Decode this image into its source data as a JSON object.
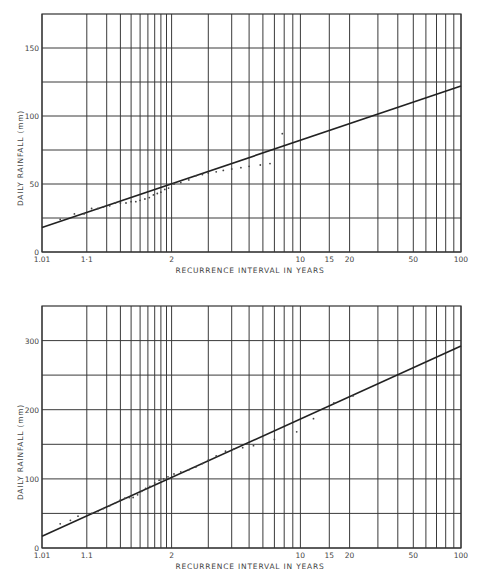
{
  "chart_data": [
    {
      "type": "line",
      "title": "",
      "xlabel": "RECURRENCE  INTERVAL  IN  YEARS",
      "ylabel": "DAILY  RAINFALL  (mm)",
      "x_scale": "gumbel-probability",
      "x_tick_labels": [
        "1.01",
        "1·1",
        "2",
        "10",
        "15",
        "20",
        "50",
        "100"
      ],
      "x_tick_values": [
        1.01,
        1.1,
        2,
        10,
        15,
        20,
        50,
        100
      ],
      "x_gridlines": [
        1.01,
        1.1,
        1.2,
        1.3,
        1.4,
        1.5,
        1.6,
        1.7,
        1.8,
        1.9,
        2,
        3,
        4,
        5,
        6,
        7,
        8,
        9,
        10,
        15,
        20,
        30,
        40,
        50,
        60,
        70,
        80,
        90,
        100
      ],
      "y_tick_labels": [
        "0",
        "50",
        "100",
        "150"
      ],
      "y_gridlines": [
        0,
        25,
        50,
        75,
        100,
        125,
        150
      ],
      "ylim": [
        0,
        175
      ],
      "xlim": [
        1.01,
        100
      ],
      "grid": true,
      "series": [
        {
          "name": "fitted line",
          "kind": "line",
          "x": [
            1.01,
            100
          ],
          "y": [
            18,
            122
          ]
        },
        {
          "name": "observed",
          "kind": "scatter",
          "x": [
            1.03,
            1.06,
            1.09,
            1.12,
            1.15,
            1.18,
            1.22,
            1.26,
            1.3,
            1.35,
            1.4,
            1.45,
            1.5,
            1.56,
            1.62,
            1.68,
            1.74,
            1.8,
            1.87,
            1.94,
            2.05,
            2.2,
            2.4,
            2.6,
            2.8,
            3.0,
            3.3,
            3.6,
            4.0,
            4.5,
            5.0,
            5.8,
            6.6,
            7.8
          ],
          "y": [
            24,
            28,
            28,
            32,
            32,
            33,
            34,
            36,
            36,
            36,
            37,
            37,
            38,
            39,
            40,
            42,
            43,
            44,
            46,
            47,
            50,
            51,
            53,
            56,
            57,
            58,
            59,
            60,
            61,
            62,
            63,
            64,
            65,
            87
          ]
        }
      ]
    },
    {
      "type": "line",
      "title": "",
      "xlabel": "RECURRENCE  INTERVAL  IN  YEARS",
      "ylabel": "DAILY  RAINFALL  (mm)",
      "x_scale": "gumbel-probability",
      "x_tick_labels": [
        "1.01",
        "1.1",
        "2",
        "10",
        "15",
        "20",
        "50",
        "100"
      ],
      "x_tick_values": [
        1.01,
        1.1,
        2,
        10,
        15,
        20,
        50,
        100
      ],
      "x_gridlines": [
        1.01,
        1.1,
        1.2,
        1.3,
        1.4,
        1.5,
        1.6,
        1.7,
        1.8,
        1.9,
        2,
        3,
        4,
        5,
        6,
        7,
        8,
        9,
        10,
        15,
        20,
        30,
        40,
        50,
        60,
        70,
        80,
        90,
        100
      ],
      "y_tick_labels": [
        "0",
        "100",
        "200",
        "300"
      ],
      "y_gridlines": [
        0,
        50,
        100,
        150,
        200,
        250,
        300
      ],
      "ylim": [
        0,
        350
      ],
      "xlim": [
        1.01,
        100
      ],
      "grid": true,
      "series": [
        {
          "name": "fitted line",
          "kind": "line",
          "x": [
            1.01,
            100
          ],
          "y": [
            17,
            292
          ]
        },
        {
          "name": "observed",
          "kind": "scatter",
          "x": [
            1.03,
            1.05,
            1.07,
            1.12,
            1.15,
            1.18,
            1.22,
            1.26,
            1.3,
            1.34,
            1.38,
            1.42,
            1.47,
            1.52,
            1.57,
            1.63,
            1.7,
            1.77,
            1.85,
            1.93,
            2.05,
            2.2,
            2.4,
            2.6,
            2.8,
            3.0,
            3.3,
            3.7,
            4.1,
            4.6,
            5.3,
            6.0,
            7.0,
            9.5,
            12,
            16,
            21
          ],
          "y": [
            35,
            40,
            46,
            50,
            53,
            57,
            61,
            65,
            70,
            72,
            73,
            73,
            77,
            82,
            86,
            89,
            94,
            98,
            100,
            103,
            107,
            110,
            113,
            117,
            122,
            127,
            133,
            140,
            143,
            145,
            148,
            150,
            157,
            168,
            187,
            210,
            220
          ]
        }
      ]
    }
  ]
}
